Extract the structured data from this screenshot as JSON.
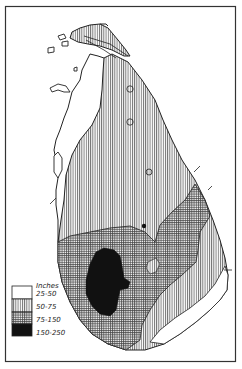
{
  "map": {
    "subject": "Sri Lanka annual rainfall",
    "colors": {
      "ink": "#1a1a1a",
      "paper": "#ffffff",
      "very_wet": "#111111"
    }
  },
  "legend": {
    "title": "Inches",
    "items": [
      {
        "label": "25-50",
        "pattern": "blank"
      },
      {
        "label": "50-75",
        "pattern": "vertical-lines"
      },
      {
        "label": "75-150",
        "pattern": "cross-hatch"
      },
      {
        "label": "150-250",
        "pattern": "solid-black"
      }
    ]
  }
}
